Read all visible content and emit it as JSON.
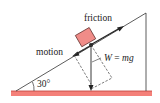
{
  "diagram": {
    "labels": {
      "friction": "friction",
      "motion": "motion",
      "weight_lhs": "W",
      "weight_eq": " = ",
      "weight_rhs": "mg",
      "angle": "30°"
    },
    "colors": {
      "block_fill": "#f08c88",
      "block_stroke": "#5a2a28",
      "ground": "#f26a62",
      "line": "#333333"
    }
  }
}
